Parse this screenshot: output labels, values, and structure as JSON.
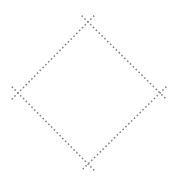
{
  "diagram": {
    "shape": "diamond",
    "stroke_color": "#8a8a8a",
    "stroke_style": "dotted",
    "corners": {
      "top": [
        88,
        22
      ],
      "right": [
        160,
        93
      ],
      "bottom": [
        88,
        164
      ],
      "left": [
        18,
        93
      ]
    },
    "overshoot_px": 9
  }
}
